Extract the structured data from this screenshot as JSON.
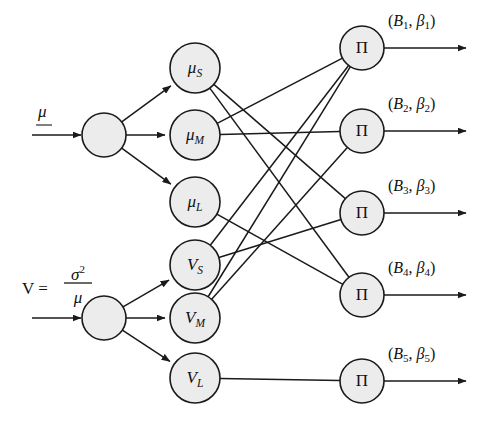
{
  "figure": {
    "type": "neural-network-diagram",
    "title": "",
    "background_color": "#ffffff",
    "node_fill_color": "#ececec",
    "stroke_color": "#1a1a1a"
  },
  "inputs": [
    {
      "id": "input-mu",
      "label": "μ",
      "label_kind": "symbol-underlined",
      "node_center": {
        "x": 104,
        "y": 135
      },
      "node_radius": 22,
      "arrow_from": {
        "x": 32,
        "y": 135
      },
      "arrow_to": {
        "x": 81,
        "y": 135
      }
    },
    {
      "id": "input-v",
      "label": "V = σ²/μ",
      "label_kind": "fraction",
      "label_lhs": "V =",
      "label_numerator": "σ",
      "label_numerator_exp": "2",
      "label_denominator": "μ",
      "node_center": {
        "x": 104,
        "y": 318
      },
      "node_radius": 22,
      "arrow_from": {
        "x": 32,
        "y": 318
      },
      "arrow_to": {
        "x": 81,
        "y": 318
      }
    }
  ],
  "hidden_nodes": [
    {
      "id": "mu-s",
      "base": "μ",
      "sub": "S",
      "x": 195,
      "y": 68,
      "r": 25,
      "from": "input-mu"
    },
    {
      "id": "mu-m",
      "base": "μ",
      "sub": "M",
      "x": 195,
      "y": 135,
      "r": 25,
      "from": "input-mu"
    },
    {
      "id": "mu-l",
      "base": "μ",
      "sub": "L",
      "x": 195,
      "y": 202,
      "r": 25,
      "from": "input-mu"
    },
    {
      "id": "v-s",
      "base": "V",
      "sub": "S",
      "x": 195,
      "y": 265,
      "r": 25,
      "from": "input-v"
    },
    {
      "id": "v-m",
      "base": "V",
      "sub": "M",
      "x": 195,
      "y": 318,
      "r": 25,
      "from": "input-v"
    },
    {
      "id": "v-l",
      "base": "V",
      "sub": "L",
      "x": 195,
      "y": 378,
      "r": 25,
      "from": "input-v"
    }
  ],
  "output_nodes": [
    {
      "id": "pi-1",
      "glyph": "Π",
      "x": 362,
      "y": 48,
      "r": 22,
      "label_base": "B",
      "label_sub": "1",
      "label_beta": "β",
      "label_text": "(B₁, β₁)",
      "label_x": 388,
      "label_y": 22,
      "arrow_from": {
        "x": 384,
        "y": 48
      },
      "arrow_to": {
        "x": 466,
        "y": 48
      }
    },
    {
      "id": "pi-2",
      "glyph": "Π",
      "x": 362,
      "y": 131,
      "r": 22,
      "label_base": "B",
      "label_sub": "2",
      "label_beta": "β",
      "label_text": "(B₂, β₂)",
      "label_x": 388,
      "label_y": 105,
      "arrow_from": {
        "x": 384,
        "y": 131
      },
      "arrow_to": {
        "x": 466,
        "y": 131
      }
    },
    {
      "id": "pi-3",
      "glyph": "Π",
      "x": 362,
      "y": 213,
      "r": 22,
      "label_base": "B",
      "label_sub": "3",
      "label_beta": "β",
      "label_text": "(B₃, β₃)",
      "label_x": 388,
      "label_y": 187,
      "arrow_from": {
        "x": 384,
        "y": 213
      },
      "arrow_to": {
        "x": 466,
        "y": 213
      }
    },
    {
      "id": "pi-4",
      "glyph": "Π",
      "x": 362,
      "y": 295,
      "r": 22,
      "label_base": "B",
      "label_sub": "4",
      "label_beta": "β",
      "label_text": "(B₄, β₄)",
      "label_x": 388,
      "label_y": 269,
      "arrow_from": {
        "x": 384,
        "y": 295
      },
      "arrow_to": {
        "x": 466,
        "y": 295
      }
    },
    {
      "id": "pi-5",
      "glyph": "Π",
      "x": 362,
      "y": 381,
      "r": 22,
      "label_base": "B",
      "label_sub": "5",
      "label_beta": "β",
      "label_text": "(B₅, β₅)",
      "label_x": 388,
      "label_y": 355,
      "arrow_from": {
        "x": 384,
        "y": 381
      },
      "arrow_to": {
        "x": 466,
        "y": 381
      }
    }
  ],
  "edges_input_to_hidden": [
    {
      "from": "input-mu",
      "to": "mu-s",
      "arrow": true
    },
    {
      "from": "input-mu",
      "to": "mu-m",
      "arrow": true
    },
    {
      "from": "input-mu",
      "to": "mu-l",
      "arrow": true
    },
    {
      "from": "input-v",
      "to": "v-s",
      "arrow": true
    },
    {
      "from": "input-v",
      "to": "v-m",
      "arrow": true
    },
    {
      "from": "input-v",
      "to": "v-l",
      "arrow": true
    }
  ],
  "edges_hidden_to_output": [
    {
      "from": "mu-s",
      "to": "pi-3",
      "arrow": false
    },
    {
      "from": "mu-s",
      "to": "pi-4",
      "arrow": false
    },
    {
      "from": "mu-m",
      "to": "pi-1",
      "arrow": false
    },
    {
      "from": "mu-m",
      "to": "pi-2",
      "arrow": false
    },
    {
      "from": "mu-l",
      "to": "pi-4",
      "arrow": false
    },
    {
      "from": "v-s",
      "to": "pi-1",
      "arrow": false
    },
    {
      "from": "v-s",
      "to": "pi-3",
      "arrow": false
    },
    {
      "from": "v-m",
      "to": "pi-1",
      "arrow": false
    },
    {
      "from": "v-m",
      "to": "pi-2",
      "arrow": false
    },
    {
      "from": "v-l",
      "to": "pi-5",
      "arrow": false
    }
  ]
}
